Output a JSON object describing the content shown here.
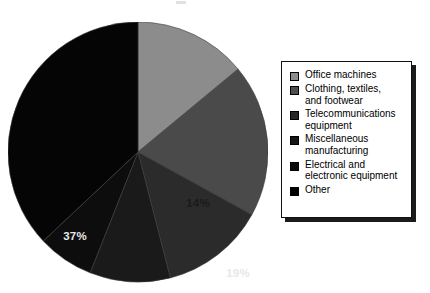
{
  "chart_data": {
    "type": "pie",
    "title": "",
    "subtitle": "",
    "xlabel": "",
    "ylabel": "",
    "grid": false,
    "legend_position": "right",
    "start_angle_deg": 0,
    "direction": "clockwise",
    "units": "percent",
    "categories": [
      "Office machines",
      "Clothing, textiles, and footwear",
      "Telecommunications equipment",
      "Miscellaneous manufacturing",
      "Electrical and electronic equipment",
      "Other"
    ],
    "values": [
      14,
      19,
      13,
      10,
      7,
      37
    ],
    "labels": [
      "14%",
      "19%",
      "13%",
      "10%",
      "7%",
      "37%"
    ],
    "colors": [
      "#8c8c8c",
      "#4a4a4a",
      "#2b2b2b",
      "#1a1a1a",
      "#0d0d0d",
      "#050505"
    ],
    "label_colors": [
      "#1a1a1a",
      "#e8e8e8",
      "#e8e8e8",
      "#e8e8e8",
      "#e8e8e8",
      "#e8e8e8"
    ],
    "slices": [
      {
        "name": "Office machines",
        "value": 14,
        "label": "14%",
        "color": "#8c8c8c",
        "label_on_dark": false,
        "label_x": 60,
        "label_y": 55
      },
      {
        "name": "Clothing, textiles, and footwear",
        "value": 19,
        "label": "19%",
        "color": "#4a4a4a",
        "label_on_dark": true,
        "label_x": 100,
        "label_y": 125
      },
      {
        "name": "Telecommunications equipment",
        "value": 13,
        "label": "13%",
        "color": "#2b2b2b",
        "label_on_dark": true,
        "label_x": 82,
        "label_y": 192
      },
      {
        "name": "Miscellaneous manufacturing",
        "value": 10,
        "label": "10%",
        "color": "#1a1a1a",
        "label_on_dark": true,
        "label_x": 25,
        "label_y": 210
      },
      {
        "name": "Electrical and electronic equipment",
        "value": 7,
        "label": "7%",
        "color": "#0d0d0d",
        "label_on_dark": true,
        "label_x": -23,
        "label_y": 194
      },
      {
        "name": "Other",
        "value": 37,
        "label": "37%",
        "color": "#050505",
        "label_on_dark": true,
        "label_x": -63,
        "label_y": 88
      }
    ]
  },
  "legend": {
    "items": [
      {
        "label": "Office machines",
        "color": "#8c8c8c"
      },
      {
        "label": "Clothing, textiles,\nand footwear",
        "color": "#4f4f4f"
      },
      {
        "label": "Telecommunications\nequipment",
        "color": "#262626"
      },
      {
        "label": "Miscellaneous\nmanufacturing",
        "color": "#161616"
      },
      {
        "label": "Electrical and\nelectronic equipment",
        "color": "#0a0a0a"
      },
      {
        "label": "Other",
        "color": "#000000"
      }
    ]
  }
}
